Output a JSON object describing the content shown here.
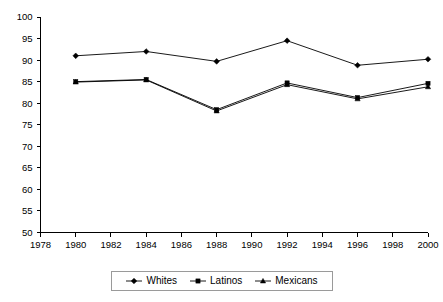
{
  "chart_data": {
    "type": "line",
    "title": "",
    "subtitle": "",
    "xlabel": "",
    "ylabel": "",
    "x": [
      1980,
      1984,
      1988,
      1992,
      1996,
      2000
    ],
    "xlim": [
      1978,
      2000
    ],
    "ylim": [
      50,
      100
    ],
    "xticks": [
      1978,
      1980,
      1982,
      1984,
      1986,
      1988,
      1990,
      1992,
      1994,
      1996,
      1998,
      2000
    ],
    "yticks": [
      50,
      55,
      60,
      65,
      70,
      75,
      80,
      85,
      90,
      95,
      100
    ],
    "grid": false,
    "legend_position": "bottom",
    "series": [
      {
        "name": "Whites",
        "marker": "diamond",
        "values": [
          91.0,
          92.0,
          89.7,
          94.5,
          88.8,
          90.2
        ]
      },
      {
        "name": "Latinos",
        "marker": "square",
        "values": [
          85.0,
          85.5,
          78.5,
          84.7,
          81.3,
          84.6
        ]
      },
      {
        "name": "Mexicans",
        "marker": "triangle",
        "values": [
          84.9,
          85.4,
          78.2,
          84.3,
          81.0,
          83.8
        ]
      }
    ]
  },
  "axis": {
    "y_tick_labels": [
      "100",
      "95",
      "90",
      "85",
      "80",
      "75",
      "70",
      "65",
      "60",
      "55",
      "50"
    ],
    "x_tick_labels": [
      "1978",
      "1980",
      "1982",
      "1984",
      "1986",
      "1988",
      "1990",
      "1992",
      "1994",
      "1996",
      "1998",
      "2000"
    ]
  },
  "legend": {
    "items": [
      {
        "label": "Whites",
        "marker": "diamond-marker-icon"
      },
      {
        "label": "Latinos",
        "marker": "square-marker-icon"
      },
      {
        "label": "Mexicans",
        "marker": "triangle-marker-icon"
      }
    ]
  },
  "colors": {
    "line": "#000000",
    "axis": "#000000",
    "legend_border": "#9a9a9a",
    "background": "#ffffff"
  }
}
